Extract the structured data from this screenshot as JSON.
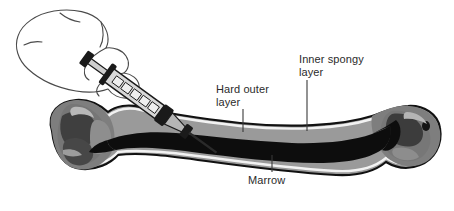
{
  "diagram": {
    "background_color": "#ffffff",
    "labels": {
      "hard_outer_layer": "Hard outer\nlayer",
      "inner_spongy_layer": "Inner spongy\nlayer",
      "marrow": "Marrow"
    },
    "colors": {
      "outline": "#111111",
      "cortical_band": "#9a9a9a",
      "spongy_bone": "#7e7e7e",
      "spongy_dark": "#3a3a3a",
      "marrow_cavity": "#0d0d0d",
      "highlight_rim": "#f2f2f2",
      "hand_outline": "#4a4a4a",
      "syringe_body": "#d8d8d8",
      "syringe_dark": "#1a1a1a",
      "leader_line": "#3a3a3a",
      "text": "#2b2b2b"
    },
    "parts": {
      "bone": "long-bone-cross-section",
      "hand": "hand-gripping-syringe",
      "syringe": "syringe-with-needle",
      "needle_entry": "needle-piercing-cortical-bone"
    }
  }
}
